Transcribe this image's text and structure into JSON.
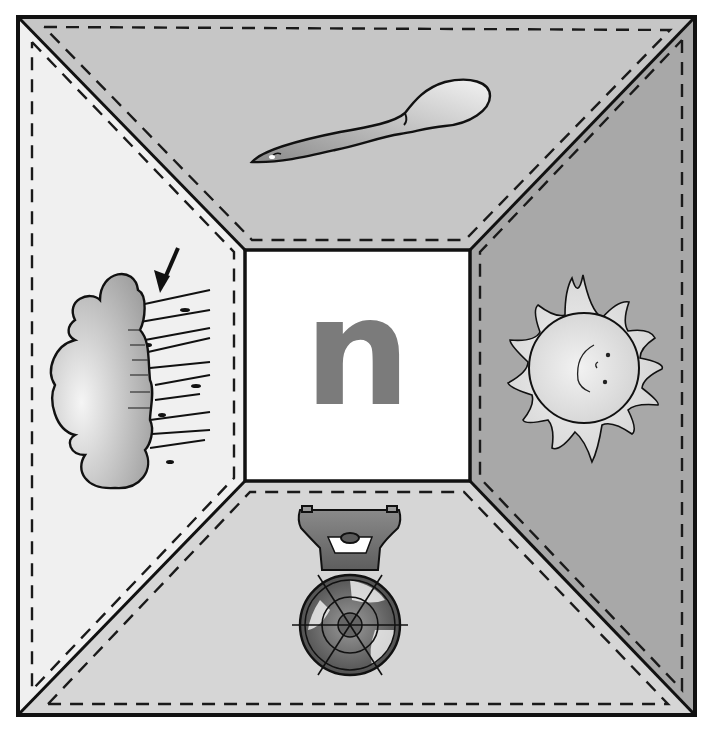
{
  "worksheet": {
    "center_letter": "n",
    "panels": {
      "top": {
        "picture": "spoon",
        "fill": "#c6c6c6"
      },
      "left": {
        "picture": "cloud-with-wind",
        "fill": "#f0f0f0"
      },
      "right": {
        "picture": "sun",
        "fill": "#a8a8a8"
      },
      "bottom": {
        "picture": "fan",
        "fill": "#d6d6d6"
      }
    },
    "center_fill": "#ffffff",
    "letter_color": "#7b7b7b",
    "line_color": "#111111"
  }
}
